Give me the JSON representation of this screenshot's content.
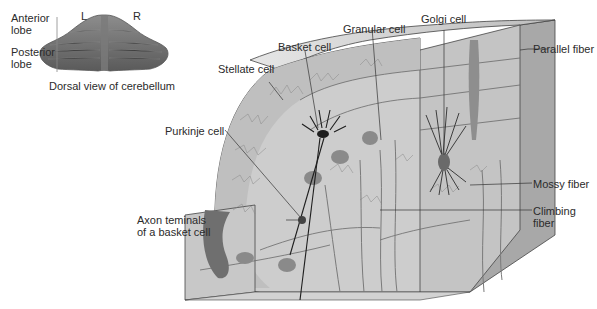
{
  "inset": {
    "left_label": "L",
    "right_label": "R",
    "anterior": [
      "Anterior",
      "lobe"
    ],
    "posterior": [
      "Posterior",
      "lobe"
    ],
    "caption": "Dorsal view of cerebellum"
  },
  "labels": {
    "stellate": "Stellate cell",
    "basket": "Basket cell",
    "granular": "Granular cell",
    "golgi": "Golgi cell",
    "parallel": "Parallel fiber",
    "purkinje": "Purkinje cell",
    "mossy": "Mossy fiber",
    "climbing": [
      "Climbing",
      "fiber"
    ],
    "axon": [
      "Axon teminals",
      "of a basket cell"
    ]
  },
  "colors": {
    "face_front": "#c9c9c9",
    "face_side": "#a9a9a9",
    "face_top": "#d6d6d6",
    "cortex": "#bdbdbd",
    "neuron": "#8a8a8a",
    "dark": "#333333",
    "line": "#3a3a3a"
  }
}
